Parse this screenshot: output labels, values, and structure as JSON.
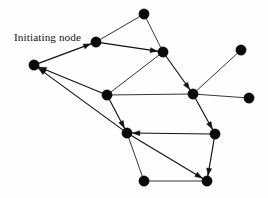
{
  "figure": {
    "background_color": "#fefefe",
    "width": 268,
    "height": 198
  },
  "labels": {
    "initiating_node": "Initiating node"
  },
  "chart_data": {
    "type": "diagram",
    "subtype": "directed-graph",
    "node_color": "#0a0a0a",
    "edge_color": "#111111",
    "node_radius": 5.2,
    "nodes": [
      {
        "id": "n0",
        "label": "Initiating node",
        "x": 96,
        "y": 42,
        "labeled": true
      },
      {
        "id": "n1",
        "label": "",
        "x": 144,
        "y": 14,
        "labeled": false
      },
      {
        "id": "n2",
        "label": "",
        "x": 163,
        "y": 52,
        "labeled": false
      },
      {
        "id": "n3",
        "label": "",
        "x": 34,
        "y": 65,
        "labeled": false
      },
      {
        "id": "n4",
        "label": "",
        "x": 241,
        "y": 50,
        "labeled": false
      },
      {
        "id": "n5",
        "label": "",
        "x": 107,
        "y": 95,
        "labeled": false
      },
      {
        "id": "n6",
        "label": "",
        "x": 193,
        "y": 94,
        "labeled": false
      },
      {
        "id": "n7",
        "label": "",
        "x": 249,
        "y": 98,
        "labeled": false
      },
      {
        "id": "n8",
        "label": "",
        "x": 127,
        "y": 133,
        "labeled": false
      },
      {
        "id": "n9",
        "label": "",
        "x": 215,
        "y": 134,
        "labeled": false
      },
      {
        "id": "n10",
        "label": "",
        "x": 144,
        "y": 181,
        "labeled": false
      },
      {
        "id": "n11",
        "label": "",
        "x": 207,
        "y": 181,
        "labeled": false
      }
    ],
    "edges": [
      {
        "from": "n0",
        "to": "n1",
        "directed": false
      },
      {
        "from": "n3",
        "to": "n0",
        "directed": true
      },
      {
        "from": "n0",
        "to": "n2",
        "directed": true
      },
      {
        "from": "n1",
        "to": "n2",
        "directed": false
      },
      {
        "from": "n5",
        "to": "n2",
        "directed": false
      },
      {
        "from": "n2",
        "to": "n6",
        "directed": true
      },
      {
        "from": "n4",
        "to": "n6",
        "directed": false
      },
      {
        "from": "n6",
        "to": "n7",
        "directed": false
      },
      {
        "from": "n5",
        "to": "n3",
        "directed": true
      },
      {
        "from": "n8",
        "to": "n3",
        "directed": true
      },
      {
        "from": "n5",
        "to": "n6",
        "directed": false
      },
      {
        "from": "n5",
        "to": "n8",
        "directed": true
      },
      {
        "from": "n6",
        "to": "n9",
        "directed": true
      },
      {
        "from": "n9",
        "to": "n8",
        "directed": true
      },
      {
        "from": "n9",
        "to": "n11",
        "directed": true
      },
      {
        "from": "n8",
        "to": "n11",
        "directed": true
      },
      {
        "from": "n8",
        "to": "n10",
        "directed": false
      },
      {
        "from": "n10",
        "to": "n11",
        "directed": false
      }
    ]
  }
}
